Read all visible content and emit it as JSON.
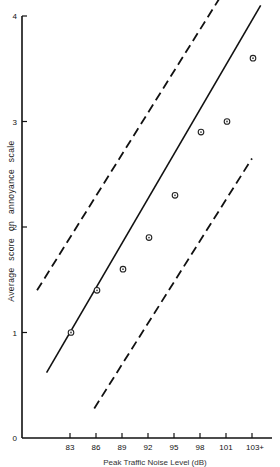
{
  "chart_data": {
    "type": "scatter",
    "title": "",
    "xlabel": "Peak Traffic Noise Level (dB)",
    "ylabel": "Average score on annoyance scale",
    "x_tick_labels": [
      "83",
      "86",
      "89",
      "92",
      "95",
      "98",
      "101",
      "103+"
    ],
    "y_tick_labels": [
      "0",
      "1",
      "2",
      "3",
      "4"
    ],
    "ylim": [
      0,
      4
    ],
    "grid": false,
    "legend": null,
    "series": [
      {
        "name": "Observed averages",
        "style": "open-circle markers",
        "x": [
          "83",
          "86",
          "89",
          "92",
          "95",
          "98",
          "101",
          "103+"
        ],
        "values": [
          1.0,
          1.4,
          1.6,
          1.9,
          2.3,
          2.9,
          3.0,
          3.6
        ]
      },
      {
        "name": "Regression line",
        "style": "solid line",
        "points": [
          [
            80.3,
            0.62
          ],
          [
            105.0,
            4.1
          ]
        ]
      },
      {
        "name": "Upper confidence limit",
        "style": "dashed line",
        "points": [
          [
            79.2,
            1.4
          ],
          [
            100.5,
            4.2
          ]
        ]
      },
      {
        "name": "Lower confidence limit",
        "style": "dashed line",
        "points": [
          [
            85.8,
            0.28
          ],
          [
            104.0,
            2.65
          ]
        ]
      }
    ]
  },
  "labels": {
    "xlabel": "Peak Traffic Noise Level (dB)",
    "ylabel": "Average score on annoyance scale"
  }
}
